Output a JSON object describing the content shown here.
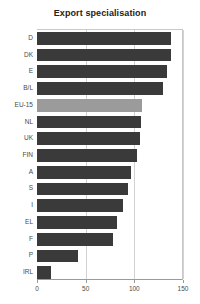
{
  "chart_data": {
    "type": "bar",
    "orientation": "horizontal",
    "title": "Export specialisation",
    "xlabel": "",
    "ylabel": "",
    "categories": [
      "D",
      "DK",
      "E",
      "B/L",
      "EU-15",
      "NL",
      "UK",
      "FIN",
      "A",
      "S",
      "I",
      "EL",
      "F",
      "P",
      "IRL"
    ],
    "values": [
      138,
      138,
      134,
      129,
      108,
      107,
      106,
      103,
      97,
      94,
      88,
      82,
      78,
      42,
      14
    ],
    "highlight_category": "EU-15",
    "xlim": [
      0,
      150
    ],
    "xticks": [
      0,
      50,
      100,
      150
    ],
    "xtick_labels": [
      "0",
      "50",
      "100",
      "150"
    ],
    "grid": true,
    "legend": false,
    "bar_color": "#3a3a3a",
    "highlight_color": "#9b9b9b",
    "grid_color": "#d2d2d2",
    "axis_color": "#9a9a9a",
    "background_color": "#ffffff"
  }
}
